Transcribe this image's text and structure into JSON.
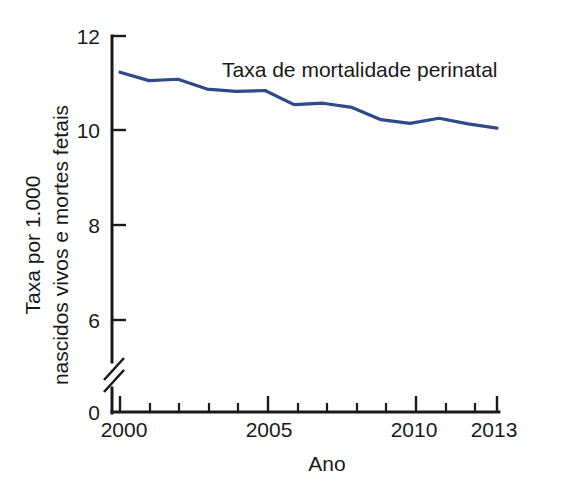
{
  "chart_data": {
    "type": "line",
    "title": "",
    "subtitle": "",
    "xlabel": "Ano",
    "ylabel": "Taxa por 1.000 nascidos vivos e mortes fetais",
    "ylabel_lines": [
      "Taxa por 1.000",
      "nascidos vivos e mortes fetais"
    ],
    "x": [
      2000,
      2001,
      2002,
      2003,
      2004,
      2005,
      2006,
      2007,
      2008,
      2009,
      2010,
      2011,
      2012,
      2013
    ],
    "categories": [
      "2000",
      "2001",
      "2002",
      "2003",
      "2004",
      "2005",
      "2006",
      "2007",
      "2008",
      "2009",
      "2010",
      "2011",
      "2012",
      "2013"
    ],
    "series": [
      {
        "name": "Taxa de mortalidade perinatal",
        "color": "#2e4a8a",
        "values": [
          11.23,
          11.05,
          11.08,
          10.87,
          10.82,
          10.84,
          10.54,
          10.57,
          10.48,
          10.22,
          10.14,
          10.25,
          10.13,
          10.04
        ]
      }
    ],
    "annotations": [
      {
        "text": "Taxa de mortalidade perinatal",
        "x": 2004.0,
        "y": 11.35
      }
    ],
    "xlim": [
      2000,
      2013
    ],
    "ylim": [
      0,
      12
    ],
    "y_ticks": [
      0,
      6,
      8,
      10,
      12
    ],
    "y_tick_labels": [
      "0",
      "6",
      "8",
      "10",
      "12"
    ],
    "x_ticks_major": [
      2000,
      2005,
      2010,
      2013
    ],
    "x_tick_labels_major": [
      "2000",
      "2005",
      "2010",
      "2013"
    ],
    "x_ticks_minor": [
      2001,
      2002,
      2003,
      2004,
      2006,
      2007,
      2008,
      2009,
      2011,
      2012
    ],
    "grid": false,
    "legend": "inline-annotation",
    "legend_position": "inline",
    "y_axis_break": true,
    "y_axis_break_between": [
      0,
      6
    ],
    "background_color": "#ffffff",
    "axis_color": "#1a1a1a"
  },
  "labels": {
    "y_axis_title_line1": "Taxa por 1.000",
    "y_axis_title_line2": "nascidos vivos e mortes fetais",
    "x_axis_title": "Ano",
    "series_annotation": "Taxa de mortalidade perinatal",
    "y_tick_12": "12",
    "y_tick_10": "10",
    "y_tick_8": "8",
    "y_tick_6": "6",
    "y_tick_0": "0",
    "x_tick_2000": "2000",
    "x_tick_2005": "2005",
    "x_tick_2010": "2010",
    "x_tick_2013": "2013"
  }
}
